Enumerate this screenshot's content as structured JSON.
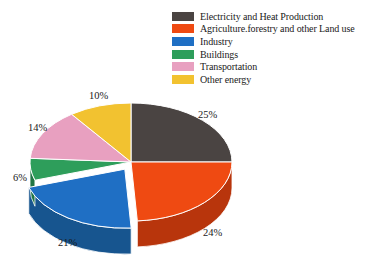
{
  "chart_data": {
    "type": "pie",
    "title": "",
    "subtitle": "",
    "xlabel": "",
    "ylabel": "",
    "legend_position": "top-right",
    "grid": false,
    "units": "percent",
    "start_angle_deg": 0,
    "direction": "clockwise",
    "three_d": true,
    "exploded_slices": [
      "Industry"
    ],
    "categories": [
      "Electricity and Heat Production",
      "Agriculture.forestry and other Land use",
      "Industry",
      "Buildings",
      "Transportation",
      "Other energy"
    ],
    "values": [
      25,
      24,
      21,
      6,
      14,
      10
    ],
    "labels": [
      "25%",
      "24%",
      "21%",
      "6%",
      "14%",
      "10%"
    ],
    "colors": [
      "#4a4442",
      "#ef4a12",
      "#1f6fc4",
      "#2e9e5b",
      "#e8a0c0",
      "#f2c230"
    ],
    "side_colors": [
      "#332f2e",
      "#b8350c",
      "#17558f",
      "#217545",
      "#c07899",
      "#c79a20"
    ]
  },
  "legend": {
    "items": [
      {
        "label": "Electricity and Heat Production",
        "color": "#4a4442"
      },
      {
        "label": "Agriculture.forestry and other Land use",
        "color": "#ef4a12"
      },
      {
        "label": "Industry",
        "color": "#1f6fc4"
      },
      {
        "label": "Buildings",
        "color": "#2e9e5b"
      },
      {
        "label": "Transportation",
        "color": "#e8a0c0"
      },
      {
        "label": "Other energy",
        "color": "#f2c230"
      }
    ]
  }
}
